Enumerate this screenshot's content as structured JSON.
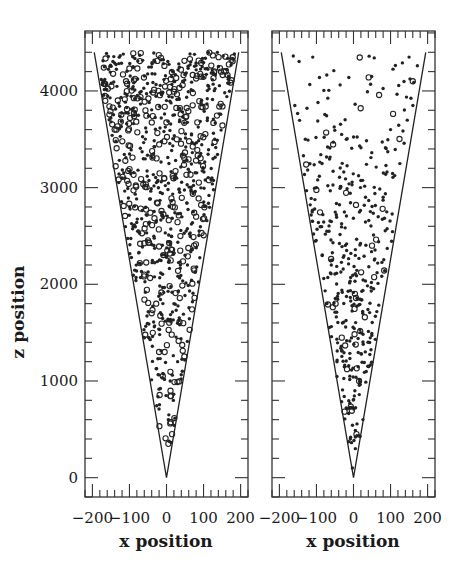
{
  "figure": {
    "ylabel": "z position",
    "panels": [
      {
        "id": "left",
        "xlabel": "x position"
      },
      {
        "id": "right",
        "xlabel": "x position"
      }
    ]
  },
  "chart_data": [
    {
      "type": "scatter",
      "title": "",
      "panel": "left",
      "xlabel": "x position",
      "ylabel": "z position",
      "xlim": [
        -220,
        220
      ],
      "ylim": [
        -200,
        4620
      ],
      "xticks": [
        -200,
        -100,
        0,
        100,
        200
      ],
      "xtick_labels": [
        "-200",
        "-100",
        "0",
        "100",
        "200"
      ],
      "yticks": [
        0,
        1000,
        2000,
        3000,
        4000
      ],
      "ytick_labels": [
        "0",
        "1000",
        "2000",
        "3000",
        "4000"
      ],
      "grid": false,
      "cone": {
        "apex": [
          0,
          0
        ],
        "top_z": 4400,
        "half_width_at_top": 195
      },
      "marker_styles": [
        "filled dot",
        "open circle"
      ],
      "density": "dense (~900 points), fills the cone fully, concentrated at z 1500-4400",
      "sample_points": [
        {
          "x": 5,
          "z": 350,
          "m": "o"
        },
        {
          "x": 15,
          "z": 450,
          "m": "o"
        },
        {
          "x": 5,
          "z": 600,
          "m": "."
        },
        {
          "x": -10,
          "z": 1050,
          "m": "o"
        },
        {
          "x": 10,
          "z": 1000,
          "m": "."
        },
        {
          "x": -20,
          "z": 1300,
          "m": "o"
        },
        {
          "x": -5,
          "z": 1300,
          "m": "o"
        },
        {
          "x": 30,
          "z": 1200,
          "m": "."
        },
        {
          "x": -40,
          "z": 1700,
          "m": "o"
        },
        {
          "x": 20,
          "z": 1800,
          "m": "."
        },
        {
          "x": -60,
          "z": 2100,
          "m": "o"
        },
        {
          "x": 50,
          "z": 2300,
          "m": "."
        },
        {
          "x": -90,
          "z": 2600,
          "m": "."
        },
        {
          "x": 80,
          "z": 2700,
          "m": "o"
        },
        {
          "x": -120,
          "z": 3100,
          "m": "."
        },
        {
          "x": 100,
          "z": 3200,
          "m": "."
        },
        {
          "x": -140,
          "z": 3600,
          "m": "o"
        },
        {
          "x": 130,
          "z": 3500,
          "m": "."
        },
        {
          "x": -170,
          "z": 4100,
          "m": "."
        },
        {
          "x": 160,
          "z": 4200,
          "m": "o"
        }
      ]
    },
    {
      "type": "scatter",
      "title": "",
      "panel": "right",
      "xlabel": "x position",
      "ylabel": "z position",
      "xlim": [
        -220,
        220
      ],
      "ylim": [
        -200,
        4620
      ],
      "xticks": [
        -200,
        -100,
        0,
        100,
        200
      ],
      "xtick_labels": [
        "-200",
        "-100",
        "0",
        "100",
        "200"
      ],
      "yticks": [
        0,
        1000,
        2000,
        3000,
        4000
      ],
      "ytick_labels": [],
      "grid": false,
      "cone": {
        "apex": [
          0,
          0
        ],
        "top_z": 4400,
        "half_width_at_top": 195
      },
      "marker_styles": [
        "filled dot",
        "open circle"
      ],
      "density": "sparse (~450 points), mostly filled dots, concentrated at z 1000-3500",
      "sample_points": [
        {
          "x": -3,
          "z": 100,
          "m": "."
        },
        {
          "x": 5,
          "z": 300,
          "m": "."
        },
        {
          "x": 8,
          "z": 450,
          "m": "o"
        },
        {
          "x": -10,
          "z": 1050,
          "m": "."
        },
        {
          "x": 15,
          "z": 1000,
          "m": "o"
        },
        {
          "x": -30,
          "z": 1600,
          "m": "."
        },
        {
          "x": 25,
          "z": 1700,
          "m": "."
        },
        {
          "x": -60,
          "z": 2200,
          "m": "."
        },
        {
          "x": 50,
          "z": 2400,
          "m": "o"
        },
        {
          "x": -100,
          "z": 3000,
          "m": "."
        },
        {
          "x": 80,
          "z": 2900,
          "m": "."
        },
        {
          "x": -130,
          "z": 3500,
          "m": "."
        },
        {
          "x": 100,
          "z": 3600,
          "m": "."
        },
        {
          "x": -110,
          "z": 4350,
          "m": "."
        },
        {
          "x": 160,
          "z": 4100,
          "m": "o"
        },
        {
          "x": 150,
          "z": 4350,
          "m": "."
        }
      ]
    }
  ]
}
